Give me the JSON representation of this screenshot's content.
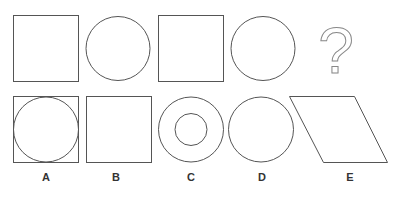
{
  "puzzle": {
    "sequence": [
      "square",
      "circle",
      "square",
      "circle",
      "?"
    ],
    "question_mark": "?",
    "stroke_color": "#555555",
    "options": [
      {
        "label": "A",
        "shape": "circle inscribed in square"
      },
      {
        "label": "B",
        "shape": "square"
      },
      {
        "label": "C",
        "shape": "concentric circles"
      },
      {
        "label": "D",
        "shape": "circle"
      },
      {
        "label": "E",
        "shape": "parallelogram"
      }
    ]
  }
}
